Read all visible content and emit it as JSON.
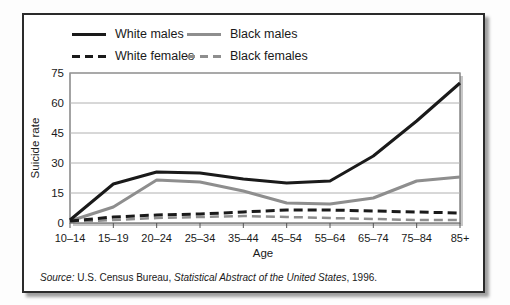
{
  "figure": {
    "legend": {
      "items": [
        {
          "label": "White males",
          "color": "#1a1a1a",
          "dashed": false
        },
        {
          "label": "Black males",
          "color": "#8e8e8e",
          "dashed": false
        },
        {
          "label": "White females",
          "color": "#1a1a1a",
          "dashed": true
        },
        {
          "label": "Black females",
          "color": "#8e8e8e",
          "dashed": true
        }
      ]
    },
    "source": {
      "prefix": "Source:",
      "org": " U.S. Census Bureau, ",
      "title": "Statistical Abstract of the United States",
      "suffix": ", 1996."
    }
  },
  "chart_data": {
    "type": "line",
    "title": "",
    "xlabel": "Age",
    "ylabel": "Suicide rate",
    "categories": [
      "10–14",
      "15–19",
      "20–24",
      "25–34",
      "35–44",
      "45–54",
      "55–64",
      "65–74",
      "75–84",
      "85+"
    ],
    "series": [
      {
        "name": "White males",
        "color": "#1a1a1a",
        "dashed": false,
        "width": 3,
        "values": [
          1.5,
          19.5,
          25.5,
          25,
          22,
          20,
          21,
          33.5,
          51,
          70
        ]
      },
      {
        "name": "Black males",
        "color": "#8e8e8e",
        "dashed": false,
        "width": 3,
        "values": [
          1,
          8,
          21.5,
          20.5,
          16,
          10,
          9.5,
          12.5,
          21,
          23
        ]
      },
      {
        "name": "White females",
        "color": "#1a1a1a",
        "dashed": true,
        "width": 3,
        "values": [
          1,
          3,
          4,
          4.5,
          5.5,
          6.5,
          6.5,
          6,
          5.5,
          5
        ]
      },
      {
        "name": "Black females",
        "color": "#8e8e8e",
        "dashed": true,
        "width": 2.5,
        "values": [
          0.5,
          1.5,
          2.5,
          3,
          3.5,
          3,
          2.5,
          2,
          1.5,
          1.5
        ]
      }
    ],
    "yticks": [
      0,
      15,
      30,
      45,
      60,
      75
    ],
    "ylim": [
      0,
      75
    ],
    "grid": true,
    "legend_position": "top-left"
  },
  "colors": {
    "grid": "#b0b0b0",
    "plot_border": "#666666",
    "plot_shadow": "#c7c7c7",
    "text": "#1a1a1a",
    "figure_border": "#2b2b2b"
  }
}
